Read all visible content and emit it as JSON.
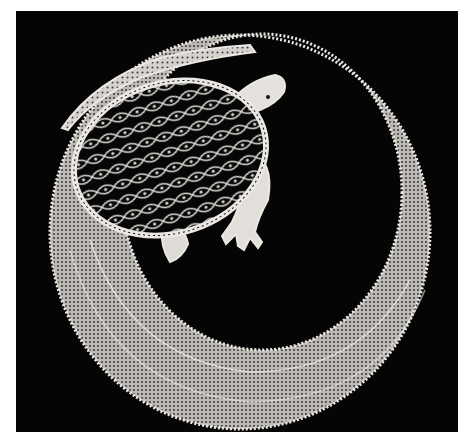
{
  "image": {
    "subject": "bobbin lace turtle on a crescent ring",
    "background_color": "#050505",
    "border_color": "#ffffff",
    "lace_color": "#e8e6e2",
    "lace_shadow_color": "#9a9894"
  },
  "elements": {
    "turtle": {
      "label": "turtle",
      "parts": [
        "shell",
        "head",
        "front-leg",
        "hind-leg",
        "tail"
      ]
    },
    "ring": {
      "label": "crescent lace ring"
    }
  }
}
